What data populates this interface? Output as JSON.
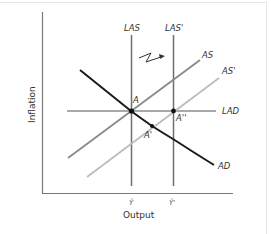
{
  "diagram": {
    "type": "AS-AD macroeconomic diagram",
    "axes": {
      "x_label": "Output",
      "y_label": "Inflation",
      "x_ticks": [
        "Ȳ",
        "Ȳ'"
      ]
    },
    "curves": {
      "las": "LAS",
      "las_prime": "LAS'",
      "as": "AS",
      "as_prime": "AS'",
      "lad": "LAD",
      "ad": "AD"
    },
    "points": {
      "a": "A",
      "a_prime": "A'",
      "a_double_prime": "A''"
    },
    "annotation": "shock-arrow",
    "colors": {
      "axis": "#7a7a7a",
      "las": "#6e6e6e",
      "as": "#8a8a8a",
      "as_prime": "#bdbdbd",
      "lad": "#555555",
      "ad": "#1a1a1a",
      "point": "#111111",
      "text": "#333333"
    }
  }
}
